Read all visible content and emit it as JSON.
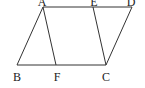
{
  "diagram": {
    "type": "parallelogram",
    "stroke_color": "#333333",
    "points": {
      "A": {
        "label": "A",
        "x": 43,
        "y": 7,
        "lx": 42,
        "ly": 6
      },
      "E": {
        "label": "E",
        "x": 93,
        "y": 7,
        "lx": 94,
        "ly": 6
      },
      "D": {
        "label": "D",
        "x": 132,
        "y": 7,
        "lx": 131,
        "ly": 6
      },
      "B": {
        "label": "B",
        "x": 17,
        "y": 65,
        "lx": 17,
        "ly": 81
      },
      "F": {
        "label": "F",
        "x": 56,
        "y": 65,
        "lx": 57,
        "ly": 81
      },
      "C": {
        "label": "C",
        "x": 106,
        "y": 65,
        "lx": 106,
        "ly": 81
      }
    },
    "segments": [
      [
        "A",
        "D"
      ],
      [
        "B",
        "C"
      ],
      [
        "A",
        "B"
      ],
      [
        "D",
        "C"
      ],
      [
        "A",
        "F"
      ],
      [
        "E",
        "C"
      ]
    ]
  }
}
